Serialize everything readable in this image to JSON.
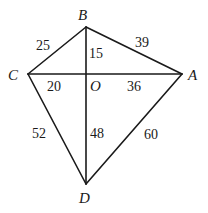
{
  "diagram": {
    "points": {
      "A": {
        "label": "A"
      },
      "B": {
        "label": "B"
      },
      "C": {
        "label": "C"
      },
      "D": {
        "label": "D"
      },
      "O": {
        "label": "O"
      }
    },
    "segments": [
      {
        "from": "C",
        "to": "B",
        "length": "25"
      },
      {
        "from": "B",
        "to": "A",
        "length": "39"
      },
      {
        "from": "B",
        "to": "O",
        "length": "15"
      },
      {
        "from": "C",
        "to": "O",
        "length": "20"
      },
      {
        "from": "O",
        "to": "A",
        "length": "36"
      },
      {
        "from": "C",
        "to": "D",
        "length": "52"
      },
      {
        "from": "O",
        "to": "D",
        "length": "48"
      },
      {
        "from": "A",
        "to": "D",
        "length": "60"
      }
    ]
  }
}
